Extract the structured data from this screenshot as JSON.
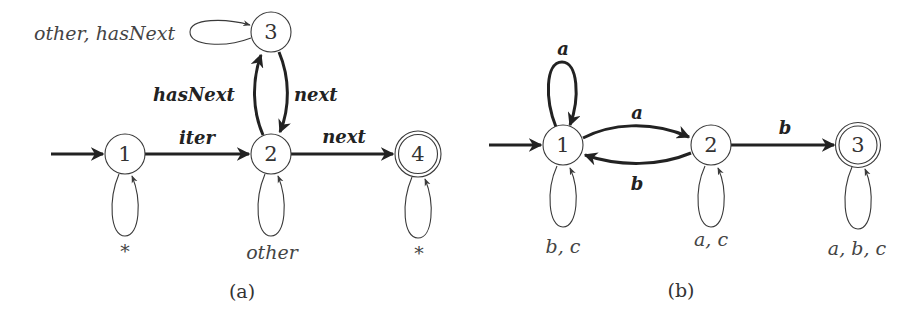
{
  "diagram_a": {
    "caption": "(a)",
    "states": [
      {
        "id": "1",
        "label": "1",
        "accepting": false,
        "initial": true
      },
      {
        "id": "2",
        "label": "2",
        "accepting": false,
        "initial": false
      },
      {
        "id": "3",
        "label": "3",
        "accepting": false,
        "initial": false
      },
      {
        "id": "4",
        "label": "4",
        "accepting": true,
        "initial": false
      }
    ],
    "transitions": [
      {
        "from": "1",
        "to": "2",
        "label": "iter",
        "emphasis": true
      },
      {
        "from": "2",
        "to": "3",
        "label": "hasNext",
        "emphasis": true
      },
      {
        "from": "3",
        "to": "2",
        "label": "next",
        "emphasis": true
      },
      {
        "from": "2",
        "to": "4",
        "label": "next",
        "emphasis": true
      },
      {
        "from": "1",
        "to": "1",
        "label": "*",
        "emphasis": false
      },
      {
        "from": "2",
        "to": "2",
        "label": "other",
        "emphasis": false
      },
      {
        "from": "3",
        "to": "3",
        "label": "other, hasNext",
        "emphasis": false
      },
      {
        "from": "4",
        "to": "4",
        "label": "*",
        "emphasis": false
      }
    ]
  },
  "diagram_b": {
    "caption": "(b)",
    "states": [
      {
        "id": "1",
        "label": "1",
        "accepting": false,
        "initial": true
      },
      {
        "id": "2",
        "label": "2",
        "accepting": false,
        "initial": false
      },
      {
        "id": "3",
        "label": "3",
        "accepting": true,
        "initial": false
      }
    ],
    "transitions": [
      {
        "from": "1",
        "to": "1",
        "label": "a",
        "emphasis": true
      },
      {
        "from": "1",
        "to": "2",
        "label": "a",
        "emphasis": true
      },
      {
        "from": "2",
        "to": "1",
        "label": "b",
        "emphasis": true
      },
      {
        "from": "2",
        "to": "3",
        "label": "b",
        "emphasis": true
      },
      {
        "from": "1",
        "to": "1",
        "label": "b, c",
        "emphasis": false
      },
      {
        "from": "2",
        "to": "2",
        "label": "a, c",
        "emphasis": false
      },
      {
        "from": "3",
        "to": "3",
        "label": "a, b, c",
        "emphasis": false
      }
    ]
  },
  "colors": {
    "stroke": "#3a3a3a",
    "emphasis_stroke": "#222222",
    "background": "#ffffff"
  }
}
